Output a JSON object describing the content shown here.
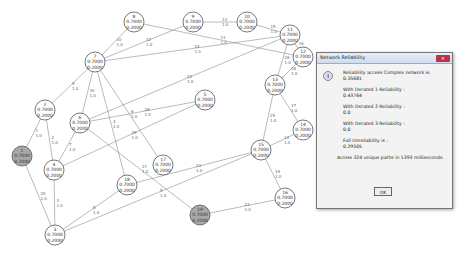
{
  "graph": {
    "nodes": [
      {
        "id": "1",
        "x": 22,
        "y": 156,
        "value": "0.7000",
        "sub": "0.2000",
        "fill": "#a8a8a8"
      },
      {
        "id": "2",
        "x": 45,
        "y": 110,
        "value": "0.7000",
        "sub": "0.2000",
        "fill": "#ffffff"
      },
      {
        "id": "3",
        "x": 55,
        "y": 235,
        "value": "0.7000",
        "sub": "0.2000",
        "fill": "#ffffff"
      },
      {
        "id": "4",
        "x": 54,
        "y": 170,
        "value": "0.7000",
        "sub": "0.2000",
        "fill": "#ffffff"
      },
      {
        "id": "5",
        "x": 205,
        "y": 100,
        "value": "0.7000",
        "sub": "0.2000",
        "fill": "#ffffff"
      },
      {
        "id": "6",
        "x": 80,
        "y": 123,
        "value": "0.7000",
        "sub": "0.2000",
        "fill": "#ffffff"
      },
      {
        "id": "7",
        "x": 95,
        "y": 62,
        "value": "0.7000",
        "sub": "0.2000",
        "fill": "#ffffff"
      },
      {
        "id": "8",
        "x": 134,
        "y": 22,
        "value": "0.7000",
        "sub": "0.2000",
        "fill": "#ffffff"
      },
      {
        "id": "9",
        "x": 193,
        "y": 22,
        "value": "0.7000",
        "sub": "0.2000",
        "fill": "#ffffff"
      },
      {
        "id": "10",
        "x": 247,
        "y": 22,
        "value": "0.7000",
        "sub": "0.2000",
        "fill": "#ffffff"
      },
      {
        "id": "11",
        "x": 290,
        "y": 35,
        "value": "0.7000",
        "sub": "0.2000",
        "fill": "#ffffff"
      },
      {
        "id": "12",
        "x": 303,
        "y": 57,
        "value": "0.7000",
        "sub": "0.2000",
        "fill": "#ffffff"
      },
      {
        "id": "13",
        "x": 275,
        "y": 85,
        "value": "0.7000",
        "sub": "0.2000",
        "fill": "#ffffff"
      },
      {
        "id": "14",
        "x": 303,
        "y": 130,
        "value": "0.7000",
        "sub": "0.2000",
        "fill": "#ffffff"
      },
      {
        "id": "15",
        "x": 261,
        "y": 150,
        "value": "0.7000",
        "sub": "0.2000",
        "fill": "#ffffff"
      },
      {
        "id": "16",
        "x": 285,
        "y": 198,
        "value": "0.7000",
        "sub": "0.2000",
        "fill": "#ffffff"
      },
      {
        "id": "17",
        "x": 163,
        "y": 165,
        "value": "0.7000",
        "sub": "0.2000",
        "fill": "#ffffff"
      },
      {
        "id": "18",
        "x": 127,
        "y": 185,
        "value": "0.7000",
        "sub": "0.2000",
        "fill": "#ffffff"
      },
      {
        "id": "19",
        "x": 200,
        "y": 215,
        "value": "0.7000",
        "sub": "0.2000",
        "fill": "#a8a8a8"
      }
    ],
    "edges": [
      {
        "from": "8",
        "to": "7",
        "id": "10",
        "w": "1.0"
      },
      {
        "from": "7",
        "to": "9",
        "id": "12",
        "w": "1.0"
      },
      {
        "from": "8",
        "to": "12",
        "id": "11",
        "w": "1.0"
      },
      {
        "from": "9",
        "to": "10",
        "id": "13",
        "w": "1.0"
      },
      {
        "from": "10",
        "to": "11",
        "id": "15",
        "w": "1.0"
      },
      {
        "from": "7",
        "to": "11",
        "id": "24",
        "w": "1.0"
      },
      {
        "from": "7",
        "to": "2",
        "id": "9",
        "w": "1.0"
      },
      {
        "from": "7",
        "to": "6",
        "id": "30",
        "w": "1.0"
      },
      {
        "from": "7",
        "to": "17",
        "id": "6",
        "w": "1.0"
      },
      {
        "from": "7",
        "to": "18",
        "id": "4",
        "w": "1.0"
      },
      {
        "from": "6",
        "to": "5",
        "id": "28",
        "w": "1.0"
      },
      {
        "from": "6",
        "to": "11",
        "id": "22",
        "w": "1.0"
      },
      {
        "from": "6",
        "to": "19",
        "id": "21",
        "w": "1.0"
      },
      {
        "from": "6",
        "to": "4",
        "id": "7",
        "w": "1.0"
      },
      {
        "from": "2",
        "to": "1",
        "id": "1",
        "w": "1.0"
      },
      {
        "from": "2",
        "to": "4",
        "id": "2",
        "w": "1.0"
      },
      {
        "from": "4",
        "to": "5",
        "id": "29",
        "w": "1.0"
      },
      {
        "from": "4",
        "to": "3",
        "id": "3",
        "w": "1.0"
      },
      {
        "from": "1",
        "to": "3",
        "id": "20",
        "w": "1.0"
      },
      {
        "from": "3",
        "to": "18",
        "id": "8",
        "w": "1.0"
      },
      {
        "from": "3",
        "to": "15",
        "id": "5",
        "w": "1.0"
      },
      {
        "from": "18",
        "to": "15",
        "id": "23",
        "w": "1.0"
      },
      {
        "from": "11",
        "to": "13",
        "id": "26",
        "w": "1.0"
      },
      {
        "from": "12",
        "to": "13",
        "id": "18",
        "w": "1.0"
      },
      {
        "from": "11",
        "to": "12",
        "id": "16",
        "w": "1.0"
      },
      {
        "from": "13",
        "to": "14",
        "id": "17",
        "w": "1.0"
      },
      {
        "from": "13",
        "to": "15",
        "id": "25",
        "w": "1.0"
      },
      {
        "from": "14",
        "to": "15",
        "id": "14",
        "w": "1.0"
      },
      {
        "from": "15",
        "to": "16",
        "id": "19",
        "w": "1.0"
      },
      {
        "from": "19",
        "to": "16",
        "id": "23",
        "w": "1.0"
      }
    ]
  },
  "dialog": {
    "title": "Network Reliability",
    "close_label": "✕",
    "icon": "i",
    "lines": [
      {
        "label": "Reliability access Complex network is:",
        "value": "0.35681"
      },
      {
        "label": "With Derated 1 Reliability :",
        "value": "0.43764"
      },
      {
        "label": "With Derated 2 Reliability :",
        "value": "0.0"
      },
      {
        "label": "With Derated 3 Reliability :",
        "value": "0.0"
      },
      {
        "label": "Full Unreliability is :",
        "value": "0.29505"
      }
    ],
    "summary": "Across 324 unique paths in 1393 milliseconds.",
    "ok_label": "OK"
  }
}
